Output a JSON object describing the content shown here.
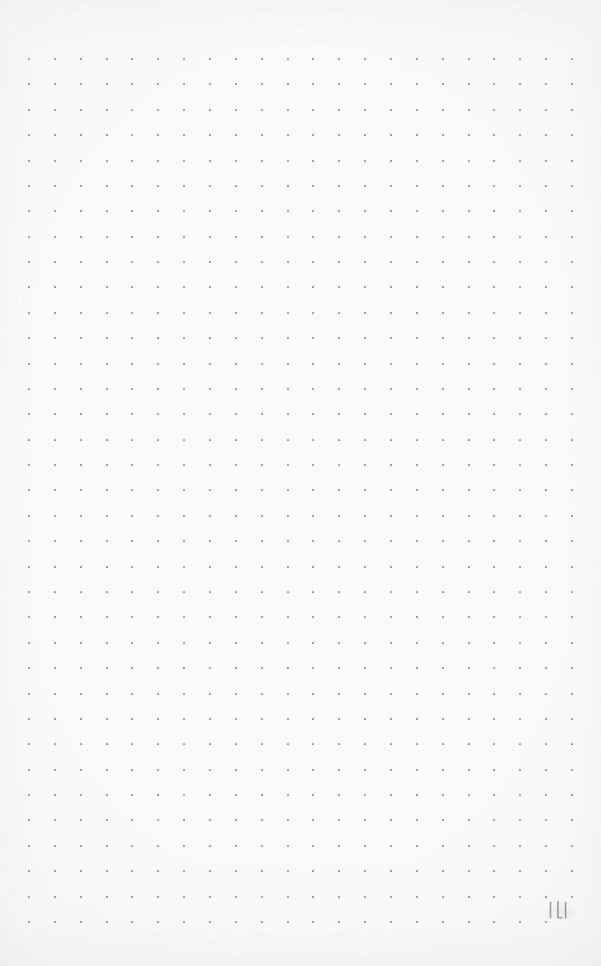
{
  "page": {
    "kind": "dot-grid-notebook-page",
    "width": 601,
    "height": 966,
    "background_color": "#fbfbfb"
  },
  "grid": {
    "columns": 22,
    "rows": 35,
    "origin_x": 29,
    "origin_y": 59,
    "spacing_x": 25.86,
    "spacing_y": 25.38,
    "dot_size": 2,
    "dot_color": "#83838c",
    "skip_cells": [
      {
        "row": 34,
        "col": 21
      }
    ]
  },
  "page_number": {
    "value": "111",
    "ink_color": "#8b8b93",
    "position": "bottom-right",
    "left": 545,
    "top": 898
  },
  "content": {
    "notes": [],
    "is_blank": true
  }
}
